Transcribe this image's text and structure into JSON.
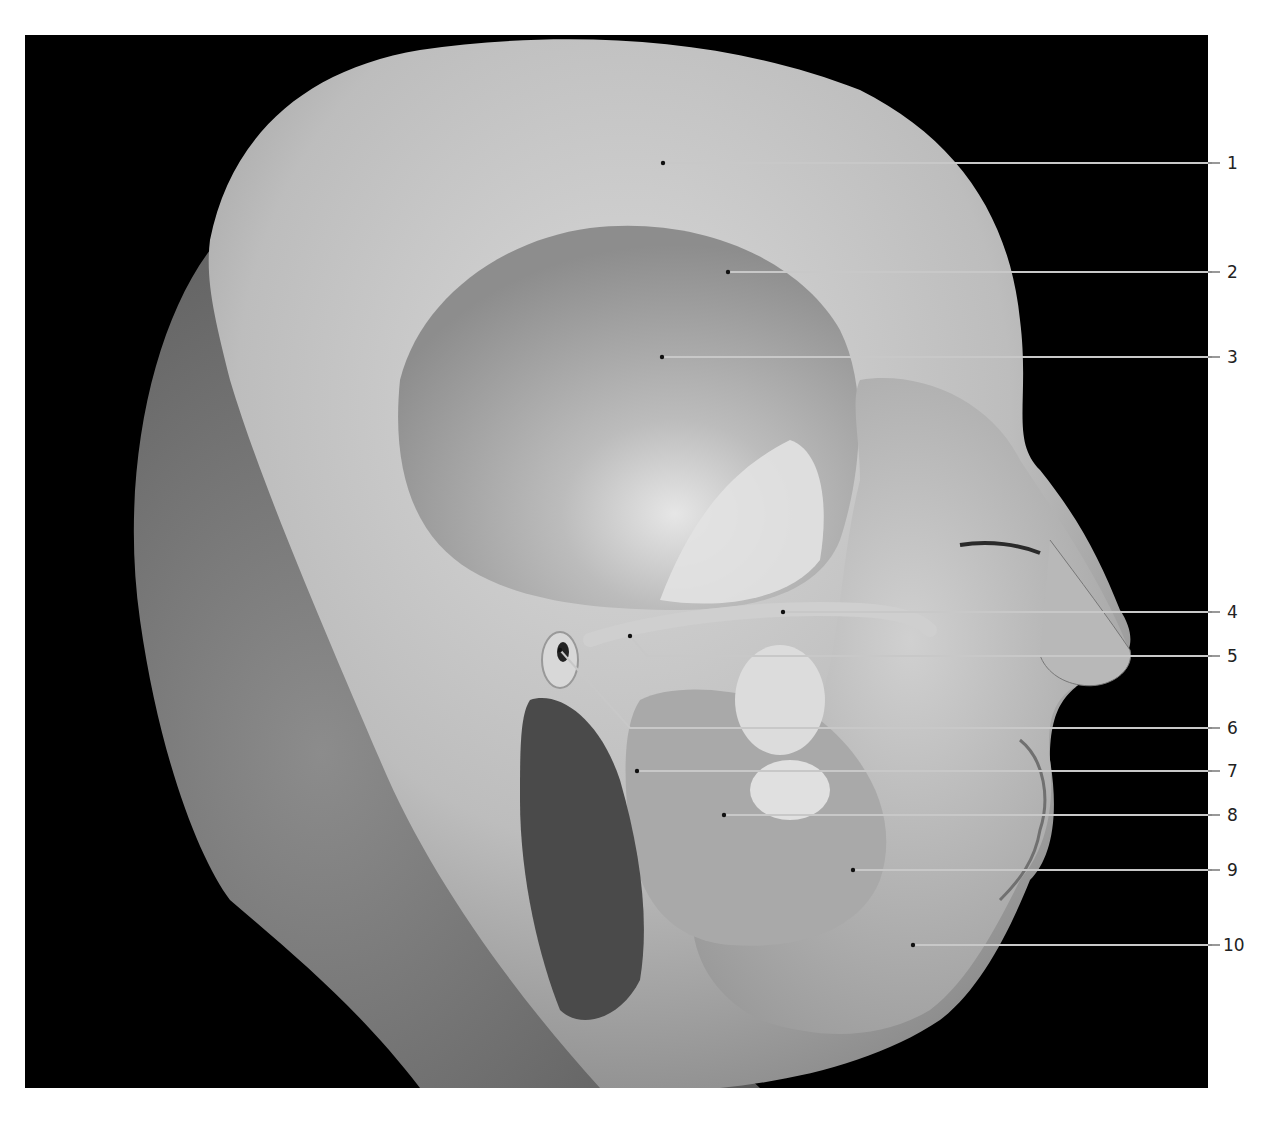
{
  "figure": {
    "background_color": "#000000",
    "frame": {
      "x": 25,
      "y": 35,
      "width": 1183,
      "height": 1053
    },
    "leader_color": "#c8c8c8",
    "label_color": "#222222"
  },
  "labels": [
    {
      "number": "1",
      "target": [
        663,
        163
      ],
      "bend": null,
      "y": 163
    },
    {
      "number": "2",
      "target": [
        728,
        272
      ],
      "bend": null,
      "y": 272
    },
    {
      "number": "3",
      "target": [
        662,
        357
      ],
      "bend": null,
      "y": 357
    },
    {
      "number": "4",
      "target": [
        783,
        612
      ],
      "bend": null,
      "y": 612
    },
    {
      "number": "5",
      "target": [
        630,
        636
      ],
      "bend": [
        647,
        656
      ],
      "y": 656
    },
    {
      "number": "6",
      "target": [
        560,
        650
      ],
      "bend": [
        630,
        728
      ],
      "y": 728
    },
    {
      "number": "7",
      "target": [
        637,
        771
      ],
      "bend": null,
      "y": 771
    },
    {
      "number": "8",
      "target": [
        724,
        815
      ],
      "bend": null,
      "y": 815
    },
    {
      "number": "9",
      "target": [
        853,
        870
      ],
      "bend": null,
      "y": 870
    },
    {
      "number": "10",
      "target": [
        913,
        945
      ],
      "bend": null,
      "y": 945
    }
  ]
}
